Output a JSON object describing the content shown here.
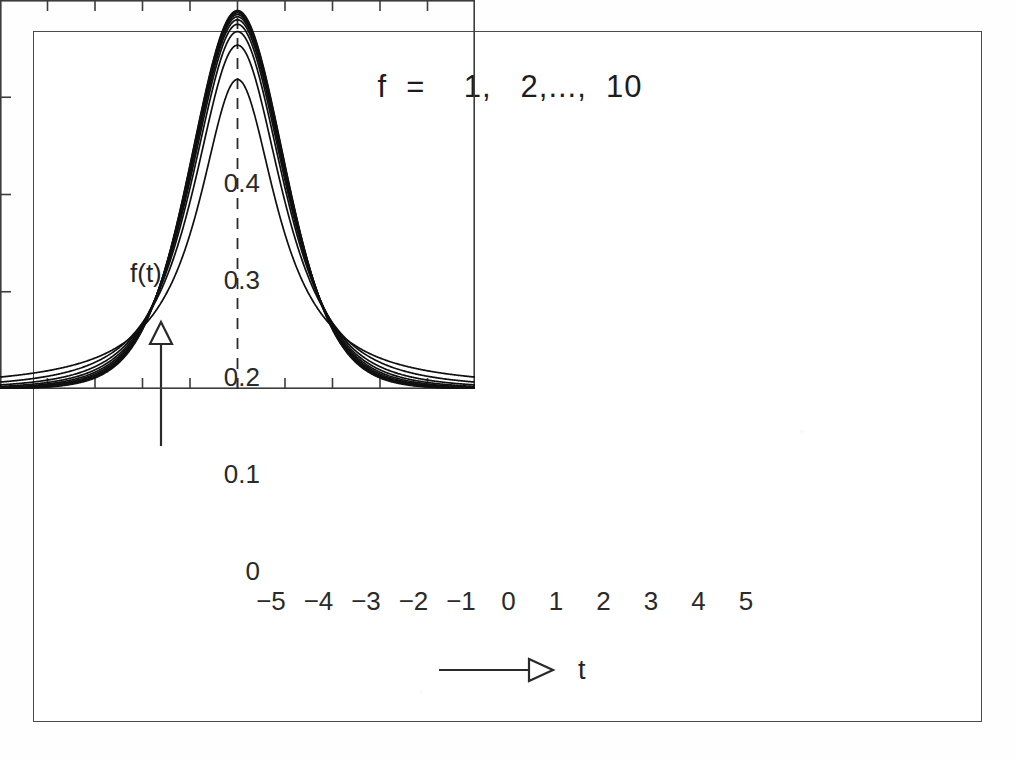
{
  "figure": {
    "title": "f  =    1,   2,...,  10",
    "border_color": "#4a4a4a",
    "background": "#ffffff",
    "curve_color": "#101010"
  },
  "axes": {
    "y_label": "f(t)",
    "x_label": "t",
    "y_arrow_icon": "up-arrow-outline-icon",
    "x_arrow_icon": "right-arrow-outline-icon",
    "y_ticks": [
      "0.4",
      "0.3",
      "0.2",
      "0.1",
      "0"
    ],
    "x_ticks": [
      "−5",
      "−4",
      "−3",
      "−2",
      "−1",
      "0",
      "1",
      "2",
      "3",
      "4",
      "5"
    ],
    "center_line": "dashed vertical reference at t = 0"
  },
  "chart_data": {
    "type": "line",
    "title": "f  =    1,   2,...,  10",
    "xlabel": "t",
    "ylabel": "f(t)",
    "xlim": [
      -5,
      5
    ],
    "ylim": [
      0,
      0.4
    ],
    "xticks": [
      -5,
      -4,
      -3,
      -2,
      -1,
      0,
      1,
      2,
      3,
      4,
      5
    ],
    "yticks": [
      0,
      0.1,
      0.2,
      0.3,
      0.4
    ],
    "grid": false,
    "legend": "none",
    "annotation": "Student's t densities for degrees of freedom f = 1, 2, ..., 10; dashed line marks t = 0",
    "x": [
      -5,
      -4.5,
      -4,
      -3.5,
      -3,
      -2.5,
      -2,
      -1.5,
      -1,
      -0.5,
      0,
      0.5,
      1,
      1.5,
      2,
      2.5,
      3,
      3.5,
      4,
      4.5,
      5
    ],
    "series": [
      {
        "name": "f = 1",
        "peak": 0.318,
        "values": [
          0.0122,
          0.015,
          0.0187,
          0.024,
          0.0318,
          0.0439,
          0.0637,
          0.0979,
          0.1592,
          0.2546,
          0.3183,
          0.2546,
          0.1592,
          0.0979,
          0.0637,
          0.0439,
          0.0318,
          0.024,
          0.0187,
          0.015,
          0.0122
        ]
      },
      {
        "name": "f = 2",
        "peak": 0.354,
        "values": [
          0.0073,
          0.0098,
          0.0131,
          0.0179,
          0.0251,
          0.0362,
          0.054,
          0.084,
          0.1361,
          0.213,
          0.3536,
          0.213,
          0.1361,
          0.084,
          0.054,
          0.0362,
          0.0251,
          0.0179,
          0.0131,
          0.0098,
          0.0073
        ]
      },
      {
        "name": "f = 3",
        "peak": 0.368,
        "values": [
          0.0044,
          0.0064,
          0.0092,
          0.0136,
          0.0205,
          0.0317,
          0.0513,
          0.0843,
          0.143,
          0.2239,
          0.3676,
          0.2239,
          0.143,
          0.0843,
          0.0513,
          0.0317,
          0.0205,
          0.0136,
          0.0092,
          0.0064,
          0.0044
        ]
      },
      {
        "name": "f = 4",
        "peak": 0.375,
        "values": [
          0.0028,
          0.0043,
          0.0066,
          0.0105,
          0.017,
          0.0282,
          0.0484,
          0.0831,
          0.1421,
          0.2323,
          0.375,
          0.2323,
          0.1421,
          0.0831,
          0.0484,
          0.0282,
          0.017,
          0.0105,
          0.0066,
          0.0043,
          0.0028
        ]
      },
      {
        "name": "f = 5",
        "peak": 0.38,
        "values": [
          0.0018,
          0.003,
          0.0048,
          0.0081,
          0.0142,
          0.0252,
          0.0456,
          0.0817,
          0.143,
          0.2361,
          0.3796,
          0.2361,
          0.143,
          0.0817,
          0.0456,
          0.0252,
          0.0142,
          0.0081,
          0.0048,
          0.003,
          0.0018
        ]
      },
      {
        "name": "f = 6",
        "peak": 0.383,
        "values": [
          0.0012,
          0.0021,
          0.0036,
          0.0064,
          0.0119,
          0.0225,
          0.043,
          0.0804,
          0.1427,
          0.2398,
          0.3827,
          0.2398,
          0.1427,
          0.0804,
          0.043,
          0.0225,
          0.0119,
          0.0064,
          0.0036,
          0.0021,
          0.0012
        ]
      },
      {
        "name": "f = 7",
        "peak": 0.385,
        "values": [
          0.0008,
          0.0015,
          0.0027,
          0.0051,
          0.0099,
          0.0201,
          0.0406,
          0.0791,
          0.1428,
          0.2424,
          0.3849,
          0.2424,
          0.1428,
          0.0791,
          0.0406,
          0.0201,
          0.0099,
          0.0051,
          0.0027,
          0.0015,
          0.0008
        ]
      },
      {
        "name": "f = 8",
        "peak": 0.387,
        "values": [
          0.0006,
          0.0011,
          0.0021,
          0.0041,
          0.0084,
          0.018,
          0.0384,
          0.0779,
          0.1428,
          0.2444,
          0.3866,
          0.2444,
          0.1428,
          0.0779,
          0.0384,
          0.018,
          0.0084,
          0.0041,
          0.0021,
          0.0011,
          0.0006
        ]
      },
      {
        "name": "f = 9",
        "peak": 0.388,
        "values": [
          0.0004,
          0.0008,
          0.0016,
          0.0033,
          0.0071,
          0.0162,
          0.0364,
          0.0768,
          0.1427,
          0.2459,
          0.388,
          0.2459,
          0.1427,
          0.0768,
          0.0364,
          0.0162,
          0.0071,
          0.0033,
          0.0016,
          0.0008,
          0.0004
        ]
      },
      {
        "name": "f = 10",
        "peak": 0.389,
        "values": [
          0.0003,
          0.0006,
          0.0013,
          0.0027,
          0.0061,
          0.0146,
          0.0345,
          0.0758,
          0.1426,
          0.2472,
          0.3891,
          0.2472,
          0.1426,
          0.0758,
          0.0345,
          0.0146,
          0.0061,
          0.0027,
          0.0013,
          0.0006,
          0.0003
        ]
      }
    ]
  }
}
